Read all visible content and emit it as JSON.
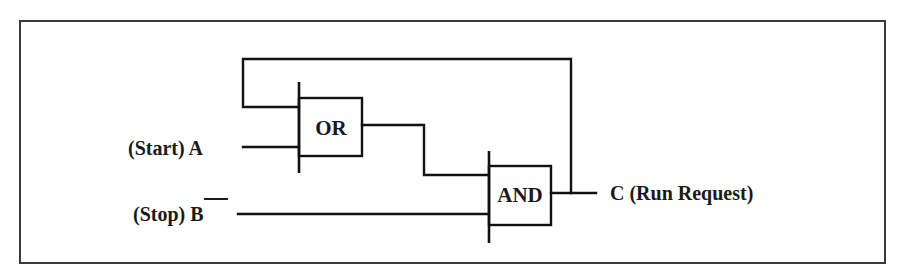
{
  "diagram": {
    "type": "logic-gate-diagram",
    "gates": [
      {
        "id": "or",
        "label": "OR"
      },
      {
        "id": "and",
        "label": "AND"
      }
    ],
    "inputs": [
      {
        "id": "A",
        "label": "(Start) A",
        "name": "(Start)",
        "symbol": "A",
        "negated": false
      },
      {
        "id": "B",
        "label": "(Stop) B",
        "name": "(Stop)",
        "symbol": "B",
        "negated": true
      }
    ],
    "output": {
      "id": "C",
      "label": "C (Run Request)"
    },
    "connections": [
      "A -> OR",
      "C (feedback) -> OR",
      "OR -> AND",
      "NOT B -> AND",
      "AND -> C"
    ],
    "colors": {
      "line": "#111111",
      "frame": "#3a3a3a",
      "background": "#ffffff"
    }
  }
}
